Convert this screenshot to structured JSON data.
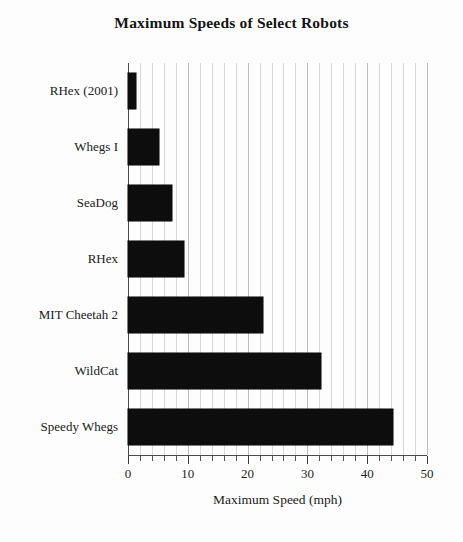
{
  "chart_data": {
    "type": "bar",
    "orientation": "horizontal",
    "title": "Maximum  Speeds of Select Robots",
    "xlabel": "Maximum Speed (mph)",
    "ylabel": "",
    "categories": [
      "RHex (2001)",
      "Whegs I",
      "SeaDog",
      "RHex",
      "MIT Cheetah 2",
      "WildCat",
      "Speedy Whegs"
    ],
    "values": [
      1.4,
      5.2,
      7.4,
      9.3,
      22.6,
      32.2,
      44.3
    ],
    "xlim": [
      0,
      50
    ],
    "xticks": [
      0,
      10,
      20,
      30,
      40,
      50
    ],
    "xticklabels": [
      "0",
      "10",
      "20",
      "30",
      "40",
      "50"
    ],
    "xminor_tick_step": 2,
    "grid": true,
    "grid_axis": "x",
    "legend": null,
    "bar_color": "#0d0d0d",
    "background_color": "#ffffff"
  },
  "figure": {
    "title_text": "Maximum  Speeds of Select Robots"
  }
}
